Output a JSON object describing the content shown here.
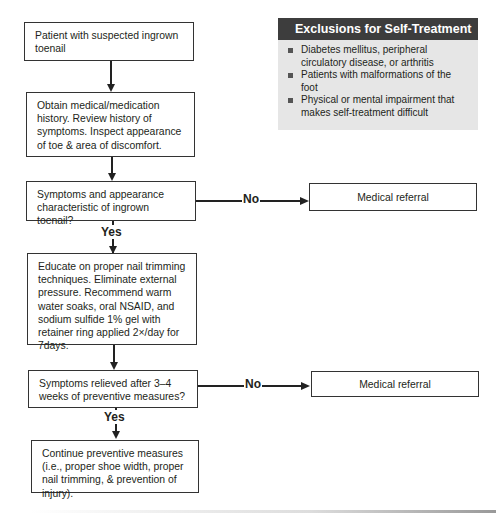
{
  "exclusions": {
    "title": "Exclusions for Self-Treatment",
    "items": [
      "Diabetes mellitus, peripheral circulatory disease, or arthritis",
      "Patients with malformations of the foot",
      "Physical or mental impairment that makes self-treatment difficult"
    ]
  },
  "flow": {
    "start": "Patient with suspected ingrown toenail",
    "history": "Obtain medical/medication history. Review history of symptoms. Inspect appearance of toe & area of discomfort.",
    "decision1": "Symptoms and appearance characteristic of ingrown toenail?",
    "decision1_no_label": "No",
    "decision1_yes_label": "Yes",
    "referral1": "Medical referral",
    "educate": "Educate on proper nail trimming techniques. Eliminate external pressure. Recommend warm water soaks, oral NSAID, and sodium sulfide 1% gel with retainer ring applied 2×/day for 7days.",
    "decision2": "Symptoms relieved after 3–4 weeks of preventive measures?",
    "decision2_no_label": "No",
    "decision2_yes_label": "Yes",
    "referral2": "Medical referral",
    "continue": "Continue preventive measures (i.e., proper shoe width, proper nail trimming, & prevention of injury)."
  }
}
